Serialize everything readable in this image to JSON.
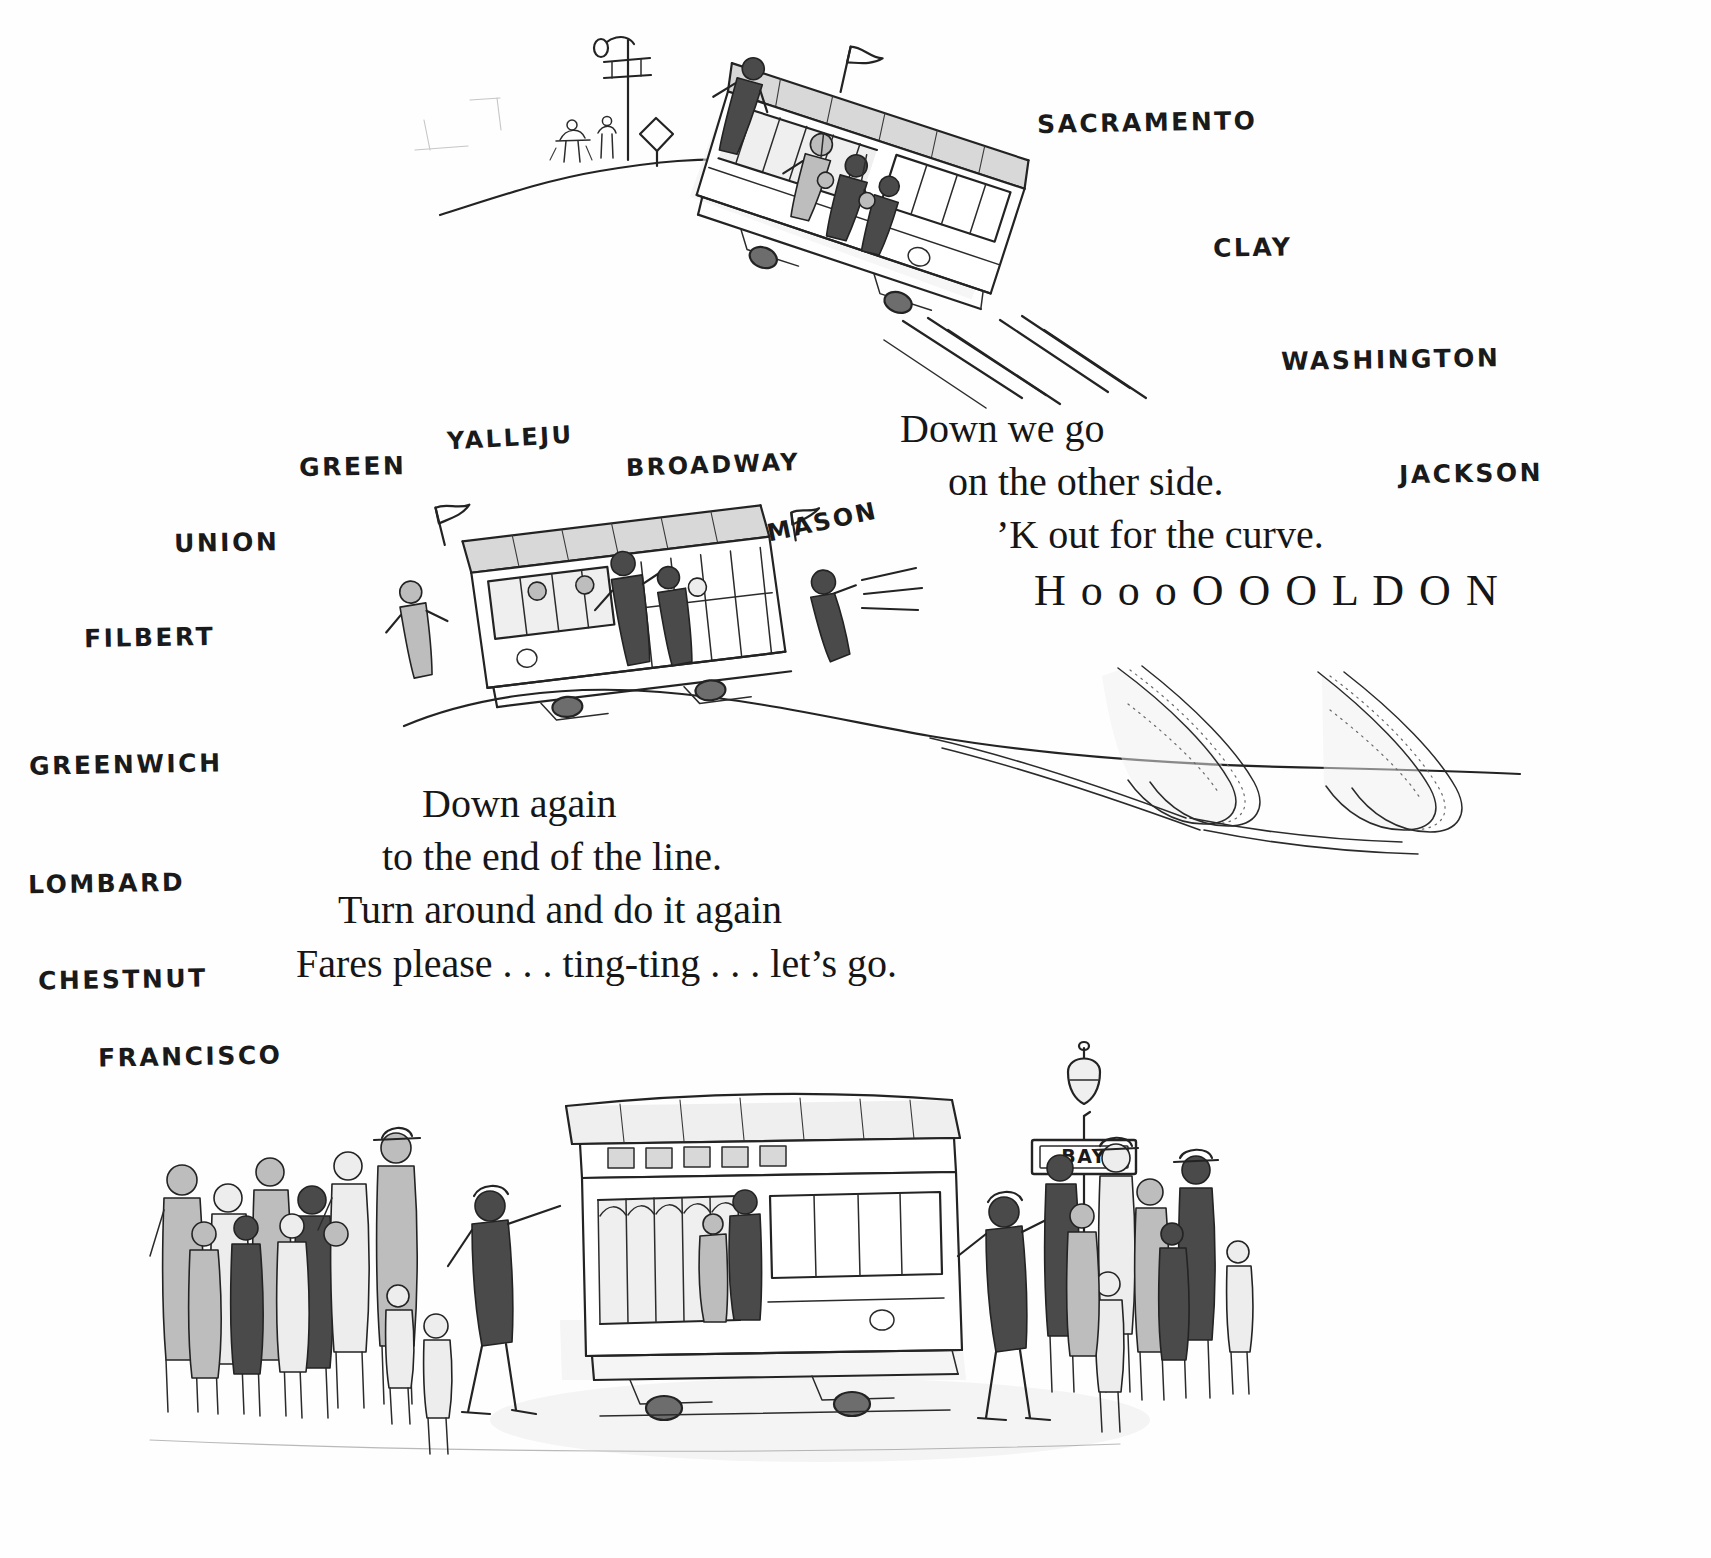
{
  "page": {
    "background_color": "#ffffff",
    "ink_color": "#232323"
  },
  "streets_right": [
    {
      "name": "SACRAMENTO",
      "label": "SACRAMENTO",
      "x": 1037,
      "y": 108,
      "rotate": -1,
      "size": 25
    },
    {
      "name": "CLAY",
      "label": "CLAY",
      "x": 1213,
      "y": 233,
      "rotate": -1,
      "size": 25
    },
    {
      "name": "WASHINGTON",
      "label": "WASHINGTON",
      "x": 1281,
      "y": 345,
      "rotate": -1,
      "size": 25
    },
    {
      "name": "JACKSON",
      "label": "JACKSON",
      "x": 1399,
      "y": 459,
      "rotate": -1,
      "size": 25
    }
  ],
  "streets_left": [
    {
      "name": "GREEN",
      "label": "GREEN",
      "x": 299,
      "y": 452,
      "rotate": -1,
      "size": 25
    },
    {
      "name": "UNION",
      "label": "UNION",
      "x": 174,
      "y": 528,
      "rotate": -1,
      "size": 25
    },
    {
      "name": "FILBERT",
      "label": "FILBERT",
      "x": 84,
      "y": 623,
      "rotate": -1,
      "size": 25
    },
    {
      "name": "GREENWICH",
      "label": "GREENWICH",
      "x": 29,
      "y": 750,
      "rotate": -1,
      "size": 25
    },
    {
      "name": "LOMBARD",
      "label": "LOMBARD",
      "x": 28,
      "y": 869,
      "rotate": -1,
      "size": 25
    },
    {
      "name": "CHESTNUT",
      "label": "CHESTNUT",
      "x": 38,
      "y": 965,
      "rotate": -1,
      "size": 25
    },
    {
      "name": "FRANCISCO",
      "label": "FRANCISCO",
      "x": 98,
      "y": 1042,
      "rotate": -1,
      "size": 25
    }
  ],
  "streets_center": [
    {
      "name": "VALLEJO",
      "label": "YALLEJU",
      "x": 447,
      "y": 424,
      "rotate": -3,
      "size": 24
    },
    {
      "name": "BROADWAY",
      "label": "BROADWAY",
      "x": 626,
      "y": 451,
      "rotate": -2,
      "size": 24
    },
    {
      "name": "MASON",
      "label": "MASON",
      "x": 766,
      "y": 508,
      "rotate": -12,
      "size": 24
    }
  ],
  "poem_upper": {
    "x": 900,
    "y": 402,
    "lines": [
      {
        "text": "Down we go",
        "indent": 0
      },
      {
        "text": "on the other side.",
        "indent": 48
      },
      {
        "text": "’K out for the curve.",
        "indent": 96
      },
      {
        "text": "H o o o O O O L D  O N",
        "indent": 134,
        "shout": true
      }
    ]
  },
  "poem_lower": {
    "x": 296,
    "y": 777,
    "lines": [
      {
        "text": "Down again",
        "indent": 126
      },
      {
        "text": "to the end of the line.",
        "indent": 86
      },
      {
        "text": "Turn around and do it again",
        "indent": 42
      },
      {
        "text": "Fares please . . . ting-ting . . . let’s go.",
        "indent": 0
      }
    ]
  },
  "signs": [
    {
      "name": "bay-stop-sign",
      "label": "BAY"
    }
  ],
  "artwork": {
    "top_cable_car": {
      "name": "cable-car-descending-hill",
      "alt": "Cable car tilted down a steep hill crowded with riders, speed lines behind"
    },
    "middle_cable_car": {
      "name": "cable-car-rounding-curve",
      "alt": "Cable car on a hill crest leaning into a curve, gripman and passengers hanging on"
    },
    "bottom_cable_car": {
      "name": "cable-car-at-terminus",
      "alt": "Cable car at the end of the line surrounded by a waiting crowd beside the BAY stop"
    },
    "hill_crest_top": {
      "name": "hilltop-horizon-line"
    },
    "hill_crest_middle": {
      "name": "hill-crest-curve-line"
    },
    "curving_tracks": {
      "name": "curving-cable-car-tracks"
    },
    "street_lamp_top": {
      "name": "street-lamp-hilltop"
    },
    "street_lamp_bottom": {
      "name": "street-lamp-bay-stop"
    },
    "speed_lines": {
      "name": "motion-speed-lines"
    },
    "crowd_left": {
      "name": "waiting-crowd-left"
    },
    "crowd_right": {
      "name": "waiting-crowd-right"
    }
  }
}
